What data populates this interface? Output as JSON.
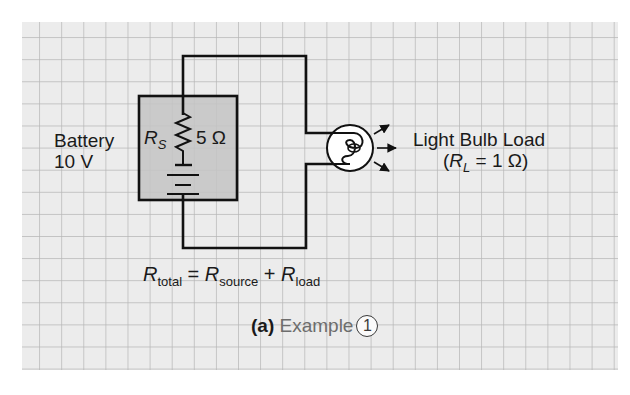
{
  "diagram": {
    "background": "#ffffff",
    "grid": {
      "fill": "#ececec",
      "line_color": "#b3b3b3",
      "x0": 22,
      "y0": 22,
      "x1": 618,
      "y1": 370,
      "spacing": 22.1
    },
    "battery_box": {
      "fill": "#c6c6c6",
      "stroke": "#111111"
    },
    "source": {
      "label_line1": "Battery",
      "label_line2": "10 V",
      "resistor_symbol": "R",
      "resistor_subscript": "S",
      "resistor_value": "5 Ω"
    },
    "load": {
      "label_line1": "Light Bulb Load",
      "label_open": "(",
      "resistor_symbol": "R",
      "resistor_subscript": "L",
      "resistor_value": " = 1 Ω)"
    },
    "equation": {
      "lhs_symbol": "R",
      "lhs_subscript": "total",
      "equals": " = ",
      "term1_symbol": "R",
      "term1_subscript": "source",
      "plus": " + ",
      "term2_symbol": "R",
      "term2_subscript": "load"
    },
    "caption": {
      "part": "(a)",
      "title": "Example",
      "number": "1"
    },
    "icons": {
      "resistor": "resistor-zigzag-icon",
      "battery": "battery-cell-icon",
      "bulb": "light-bulb-icon",
      "light_rays": "light-ray-arrows-icon"
    }
  }
}
